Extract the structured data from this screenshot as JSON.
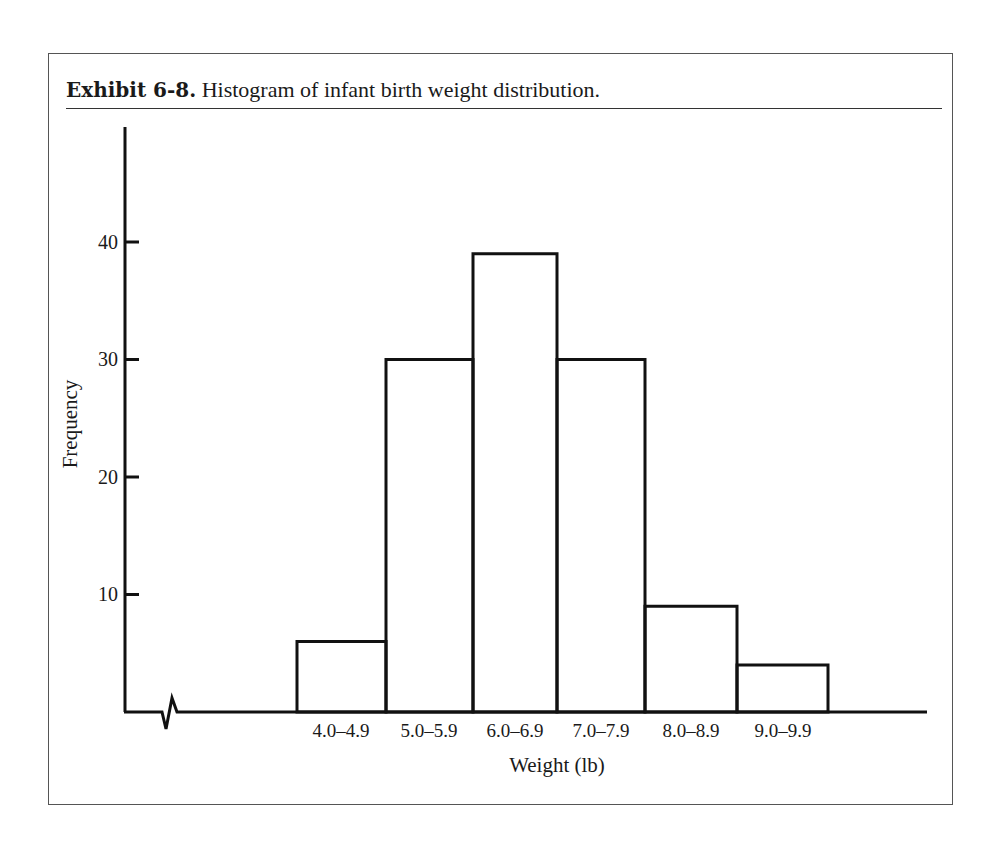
{
  "title": {
    "label": "Exhibit 6-8.",
    "text": " Histogram of infant birth weight distribution."
  },
  "axes": {
    "ylabel": "Frequency",
    "xlabel": "Weight (lb)",
    "yticks": [
      "10",
      "20",
      "30",
      "40"
    ],
    "xticks": [
      "4.0–4.9",
      "5.0–5.9",
      "6.0–6.9",
      "7.0–7.9",
      "8.0–8.9",
      "9.0–9.9"
    ]
  },
  "chart_data": {
    "type": "bar",
    "title": "Exhibit 6-8. Histogram of infant birth weight distribution.",
    "xlabel": "Weight (lb)",
    "ylabel": "Frequency",
    "categories": [
      "4.0–4.9",
      "5.0–5.9",
      "6.0–6.9",
      "7.0–7.9",
      "8.0–8.9",
      "9.0–9.9"
    ],
    "values": [
      6,
      30,
      39,
      30,
      9,
      4
    ],
    "yticks": [
      10,
      20,
      30,
      40
    ],
    "ylim": [
      0,
      49
    ],
    "grid": false,
    "legend": null,
    "x_axis_break": true,
    "bar_style": "outlined, no fill, adjacent bars"
  }
}
